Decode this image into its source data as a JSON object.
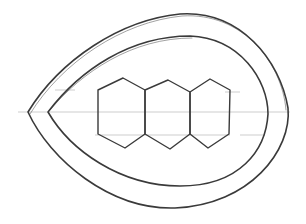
{
  "drawing": {
    "description": "pencil sketch",
    "shapes": [
      {
        "type": "teardrop-outline",
        "role": "outer"
      },
      {
        "type": "teardrop-outline",
        "role": "inner"
      },
      {
        "type": "hexagon",
        "index": 1
      },
      {
        "type": "hexagon",
        "index": 2
      },
      {
        "type": "hexagon",
        "index": 3
      }
    ],
    "stroke_color": "#3a3a3a"
  }
}
